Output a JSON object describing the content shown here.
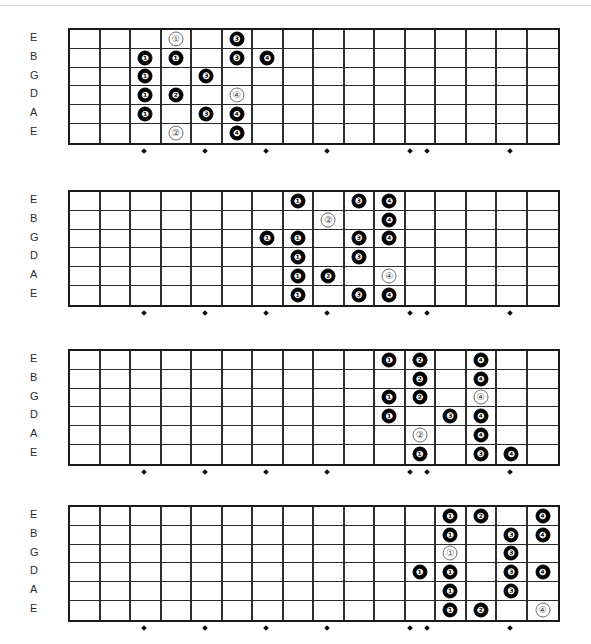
{
  "page": {
    "diagram_count": 4,
    "fret_count": 16,
    "string_count": 6
  },
  "strings": [
    "E",
    "B",
    "G",
    "D",
    "A",
    "E"
  ],
  "fret_markers": [
    3,
    5,
    7,
    9,
    12,
    12,
    15
  ],
  "fret_marker_offsets": [
    3,
    5,
    7,
    9,
    11.72,
    12.28,
    15
  ],
  "legend": {
    "filled_meaning": "fingering number (filled)",
    "open_meaning": "fingering number (outline)"
  },
  "chart_data": {
    "type": "table",
    "xlabel": "Fret",
    "ylabel": "String",
    "categories": [
      "E",
      "B",
      "G",
      "D",
      "A",
      "E"
    ],
    "diagrams": [
      {
        "name": "position-1",
        "notes": [
          {
            "string": 0,
            "fret": 4,
            "label": "1",
            "style": "open"
          },
          {
            "string": 0,
            "fret": 6,
            "label": "3",
            "style": "filled"
          },
          {
            "string": 1,
            "fret": 3,
            "label": "1",
            "style": "filled"
          },
          {
            "string": 1,
            "fret": 4,
            "label": "1",
            "style": "filled"
          },
          {
            "string": 1,
            "fret": 6,
            "label": "3",
            "style": "filled"
          },
          {
            "string": 1,
            "fret": 7,
            "label": "4",
            "style": "filled"
          },
          {
            "string": 2,
            "fret": 3,
            "label": "1",
            "style": "filled"
          },
          {
            "string": 2,
            "fret": 5,
            "label": "3",
            "style": "filled"
          },
          {
            "string": 3,
            "fret": 3,
            "label": "1",
            "style": "filled"
          },
          {
            "string": 3,
            "fret": 4,
            "label": "2",
            "style": "filled"
          },
          {
            "string": 3,
            "fret": 6,
            "label": "4",
            "style": "open"
          },
          {
            "string": 4,
            "fret": 3,
            "label": "1",
            "style": "filled"
          },
          {
            "string": 4,
            "fret": 5,
            "label": "3",
            "style": "filled"
          },
          {
            "string": 4,
            "fret": 6,
            "label": "4",
            "style": "filled"
          },
          {
            "string": 5,
            "fret": 4,
            "label": "2",
            "style": "open"
          },
          {
            "string": 5,
            "fret": 6,
            "label": "4",
            "style": "filled"
          }
        ]
      },
      {
        "name": "position-2",
        "notes": [
          {
            "string": 0,
            "fret": 8,
            "label": "1",
            "style": "filled"
          },
          {
            "string": 0,
            "fret": 10,
            "label": "3",
            "style": "filled"
          },
          {
            "string": 0,
            "fret": 11,
            "label": "4",
            "style": "filled"
          },
          {
            "string": 1,
            "fret": 9,
            "label": "2",
            "style": "open"
          },
          {
            "string": 1,
            "fret": 11,
            "label": "4",
            "style": "filled"
          },
          {
            "string": 2,
            "fret": 7,
            "label": "1",
            "style": "filled"
          },
          {
            "string": 2,
            "fret": 8,
            "label": "1",
            "style": "filled"
          },
          {
            "string": 2,
            "fret": 10,
            "label": "3",
            "style": "filled"
          },
          {
            "string": 2,
            "fret": 11,
            "label": "4",
            "style": "filled"
          },
          {
            "string": 3,
            "fret": 8,
            "label": "1",
            "style": "filled"
          },
          {
            "string": 3,
            "fret": 10,
            "label": "3",
            "style": "filled"
          },
          {
            "string": 4,
            "fret": 8,
            "label": "1",
            "style": "filled"
          },
          {
            "string": 4,
            "fret": 9,
            "label": "2",
            "style": "filled"
          },
          {
            "string": 4,
            "fret": 11,
            "label": "4",
            "style": "open"
          },
          {
            "string": 5,
            "fret": 8,
            "label": "1",
            "style": "filled"
          },
          {
            "string": 5,
            "fret": 10,
            "label": "3",
            "style": "filled"
          },
          {
            "string": 5,
            "fret": 11,
            "label": "4",
            "style": "filled"
          }
        ]
      },
      {
        "name": "position-3",
        "notes": [
          {
            "string": 0,
            "fret": 11,
            "label": "1",
            "style": "filled"
          },
          {
            "string": 0,
            "fret": 12,
            "label": "2",
            "style": "filled"
          },
          {
            "string": 0,
            "fret": 14,
            "label": "4",
            "style": "filled"
          },
          {
            "string": 1,
            "fret": 12,
            "label": "2",
            "style": "filled"
          },
          {
            "string": 1,
            "fret": 14,
            "label": "4",
            "style": "filled"
          },
          {
            "string": 2,
            "fret": 11,
            "label": "1",
            "style": "filled"
          },
          {
            "string": 2,
            "fret": 12,
            "label": "2",
            "style": "filled"
          },
          {
            "string": 2,
            "fret": 14,
            "label": "4",
            "style": "open"
          },
          {
            "string": 3,
            "fret": 11,
            "label": "1",
            "style": "filled"
          },
          {
            "string": 3,
            "fret": 13,
            "label": "3",
            "style": "filled"
          },
          {
            "string": 3,
            "fret": 14,
            "label": "4",
            "style": "filled"
          },
          {
            "string": 4,
            "fret": 12,
            "label": "2",
            "style": "open"
          },
          {
            "string": 4,
            "fret": 14,
            "label": "4",
            "style": "filled"
          },
          {
            "string": 5,
            "fret": 12,
            "label": "1",
            "style": "filled"
          },
          {
            "string": 5,
            "fret": 14,
            "label": "3",
            "style": "filled"
          },
          {
            "string": 5,
            "fret": 15,
            "label": "4",
            "style": "filled"
          }
        ]
      },
      {
        "name": "position-4",
        "notes": [
          {
            "string": 0,
            "fret": 13,
            "label": "1",
            "style": "filled"
          },
          {
            "string": 0,
            "fret": 14,
            "label": "2",
            "style": "filled"
          },
          {
            "string": 0,
            "fret": 16,
            "label": "4",
            "style": "filled"
          },
          {
            "string": 1,
            "fret": 13,
            "label": "1",
            "style": "filled"
          },
          {
            "string": 1,
            "fret": 15,
            "label": "3",
            "style": "filled"
          },
          {
            "string": 1,
            "fret": 16,
            "label": "4",
            "style": "filled"
          },
          {
            "string": 2,
            "fret": 13,
            "label": "1",
            "style": "open"
          },
          {
            "string": 2,
            "fret": 15,
            "label": "3",
            "style": "filled"
          },
          {
            "string": 3,
            "fret": 12,
            "label": "1",
            "style": "filled"
          },
          {
            "string": 3,
            "fret": 13,
            "label": "1",
            "style": "filled"
          },
          {
            "string": 3,
            "fret": 15,
            "label": "3",
            "style": "filled"
          },
          {
            "string": 3,
            "fret": 16,
            "label": "4",
            "style": "filled"
          },
          {
            "string": 4,
            "fret": 13,
            "label": "1",
            "style": "filled"
          },
          {
            "string": 4,
            "fret": 15,
            "label": "3",
            "style": "filled"
          },
          {
            "string": 5,
            "fret": 13,
            "label": "1",
            "style": "filled"
          },
          {
            "string": 5,
            "fret": 14,
            "label": "2",
            "style": "filled"
          },
          {
            "string": 5,
            "fret": 16,
            "label": "4",
            "style": "open"
          }
        ]
      }
    ]
  }
}
